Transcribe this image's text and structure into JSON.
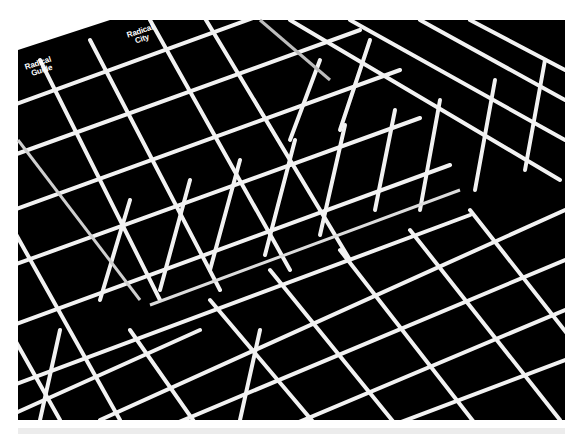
{
  "image": {
    "description": "Photograph of black posters printed with white isometric cube grid pattern, overlapping and creased",
    "colors": {
      "background": "#ffffff",
      "poster": "#000000",
      "lines": "#f2f2f2",
      "strip": "#ececec"
    }
  },
  "labels": [
    {
      "line1": "Radical",
      "line2": "Guide"
    },
    {
      "line1": "Radical",
      "line2": "City"
    }
  ]
}
